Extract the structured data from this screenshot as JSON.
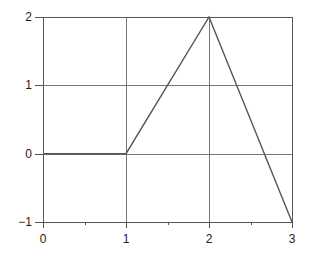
{
  "chart_data": {
    "type": "line",
    "title": "",
    "xlabel": "",
    "ylabel": "",
    "xlim": [
      0,
      3
    ],
    "ylim": [
      -1,
      2
    ],
    "grid": true,
    "x_ticks": [
      0,
      1,
      2,
      3
    ],
    "x_tick_labels": [
      "0",
      "1",
      "2",
      "3"
    ],
    "x_minor_ticks": [
      0.5,
      1.5,
      2.5
    ],
    "y_ticks": [
      -1,
      0,
      1,
      2
    ],
    "y_tick_labels": [
      "−1",
      "0",
      "1",
      "2"
    ],
    "series": [
      {
        "name": "piecewise-linear",
        "x": [
          0,
          1,
          2,
          3
        ],
        "y": [
          0,
          0,
          2,
          -1
        ],
        "color": "#555555"
      }
    ]
  },
  "colors": {
    "axis": "#555555",
    "grid": "#777777",
    "line": "#555555",
    "background": "#ffffff"
  }
}
